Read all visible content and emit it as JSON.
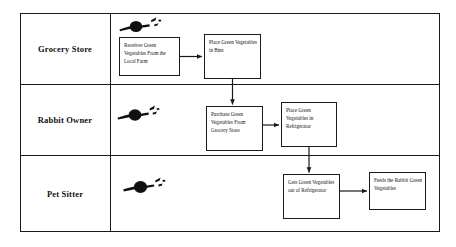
{
  "diagram": {
    "type": "swimlane-flowchart",
    "lanes": [
      {
        "id": "grocery-store",
        "label": "Grocery Store",
        "actor_icon": "person-blob-icon"
      },
      {
        "id": "rabbit-owner",
        "label": "Rabbit Owner",
        "actor_icon": "person-blob-icon"
      },
      {
        "id": "pet-sitter",
        "label": "Pet Sitter",
        "actor_icon": "person-blob-icon"
      }
    ],
    "steps": [
      {
        "id": "receives",
        "lane": "grocery-store",
        "text": "Receives Green Vegetables From the Local Farm"
      },
      {
        "id": "place-bins",
        "lane": "grocery-store",
        "text": "Place Green Vegetables in Bins"
      },
      {
        "id": "purchase",
        "lane": "rabbit-owner",
        "text": "Purchase Green Vegetables From Grocery Store"
      },
      {
        "id": "place-refrigerator",
        "lane": "rabbit-owner",
        "text": "Place Green Vegetables in Refrigerator"
      },
      {
        "id": "gets-out",
        "lane": "pet-sitter",
        "text": "Gets Green Vegetables out of Refrigerator"
      },
      {
        "id": "feeds",
        "lane": "pet-sitter",
        "text": "Feeds the Rabbit Green Vegetables"
      }
    ],
    "connectors": [
      {
        "from": "receives",
        "to": "place-bins",
        "direction": "right"
      },
      {
        "from": "place-bins",
        "to": "purchase",
        "direction": "down"
      },
      {
        "from": "purchase",
        "to": "place-refrigerator",
        "direction": "right"
      },
      {
        "from": "place-refrigerator",
        "to": "gets-out",
        "direction": "down"
      },
      {
        "from": "gets-out",
        "to": "feeds",
        "direction": "right"
      }
    ],
    "colors": {
      "line": "#1a1a1a",
      "text": "#111111",
      "background": "#ffffff"
    }
  }
}
